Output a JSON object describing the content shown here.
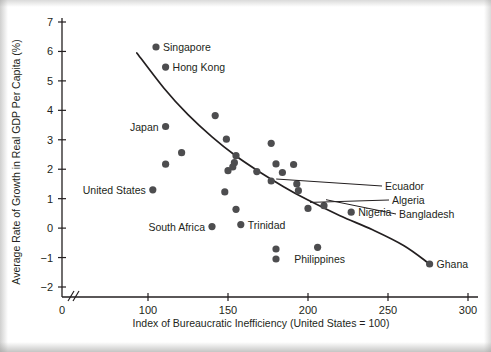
{
  "chart_data": {
    "type": "scatter",
    "title": "",
    "xlabel": "Index of Bureaucratic Inefficiency (United States = 100)",
    "ylabel": "Average Rate of Growth in Real GDP Per Capita (%)",
    "xlim": [
      88,
      305
    ],
    "ylim": [
      -2.6,
      7.3
    ],
    "xticks": [
      0,
      100,
      150,
      200,
      250,
      300
    ],
    "yticks": [
      -2,
      -1,
      0,
      1,
      2,
      3,
      4,
      5,
      6,
      7
    ],
    "xtick_labels": [
      "0",
      "100",
      "150",
      "200",
      "250",
      "300"
    ],
    "ytick_labels": [
      "−2",
      "−1",
      "0",
      "1",
      "2",
      "3",
      "4",
      "5",
      "6",
      "7"
    ],
    "grid": false,
    "legend": null,
    "axis_break": true,
    "axis_break_note": "x-axis broken between 0 and 100",
    "points": [
      {
        "label": "Singapore",
        "x": 105,
        "y": 6.15,
        "label_pos": "right"
      },
      {
        "label": "Hong Kong",
        "x": 111,
        "y": 5.47,
        "label_pos": "right"
      },
      {
        "label": "Japan",
        "x": 111,
        "y": 3.45,
        "label_pos": "left"
      },
      {
        "label": "United States",
        "x": 103,
        "y": 1.3,
        "label_pos": "left"
      },
      {
        "label": "South Africa",
        "x": 140,
        "y": 0.05,
        "label_pos": "left"
      },
      {
        "label": "Trinidad",
        "x": 158,
        "y": 0.12,
        "label_pos": "right"
      },
      {
        "label": "Ecuador",
        "x": 177,
        "y": 1.6,
        "label_pos": "leader"
      },
      {
        "label": "Algeria",
        "x": 200,
        "y": 0.67,
        "label_pos": "leader"
      },
      {
        "label": "Bangladesh",
        "x": 210,
        "y": 0.76,
        "label_pos": "leader"
      },
      {
        "label": "Nigeria",
        "x": 227,
        "y": 0.54,
        "label_pos": "right"
      },
      {
        "label": "Philippines",
        "x": 206,
        "y": -0.65,
        "label_pos": "below"
      },
      {
        "label": "Ghana",
        "x": 276,
        "y": -1.22,
        "label_pos": "right"
      },
      {
        "label": "",
        "x": 142,
        "y": 3.82,
        "label_pos": "none"
      },
      {
        "label": "",
        "x": 149,
        "y": 3.02,
        "label_pos": "none"
      },
      {
        "label": "",
        "x": 177,
        "y": 2.88,
        "label_pos": "none"
      },
      {
        "label": "",
        "x": 121,
        "y": 2.56,
        "label_pos": "none"
      },
      {
        "label": "",
        "x": 155,
        "y": 2.46,
        "label_pos": "none"
      },
      {
        "label": "",
        "x": 154,
        "y": 2.22,
        "label_pos": "none"
      },
      {
        "label": "",
        "x": 111,
        "y": 2.17,
        "label_pos": "none"
      },
      {
        "label": "",
        "x": 180,
        "y": 2.18,
        "label_pos": "none"
      },
      {
        "label": "",
        "x": 191,
        "y": 2.16,
        "label_pos": "none"
      },
      {
        "label": "",
        "x": 153,
        "y": 2.08,
        "label_pos": "none"
      },
      {
        "label": "",
        "x": 150,
        "y": 1.95,
        "label_pos": "none"
      },
      {
        "label": "",
        "x": 168,
        "y": 1.92,
        "label_pos": "none"
      },
      {
        "label": "",
        "x": 184,
        "y": 1.89,
        "label_pos": "none"
      },
      {
        "label": "",
        "x": 193,
        "y": 1.5,
        "label_pos": "none"
      },
      {
        "label": "",
        "x": 194,
        "y": 1.27,
        "label_pos": "none"
      },
      {
        "label": "",
        "x": 148,
        "y": 1.23,
        "label_pos": "none"
      },
      {
        "label": "",
        "x": 155,
        "y": 0.64,
        "label_pos": "none"
      },
      {
        "label": "",
        "x": 180,
        "y": -0.71,
        "label_pos": "none"
      },
      {
        "label": "",
        "x": 180,
        "y": -1.05,
        "label_pos": "none"
      }
    ],
    "trend_curve": {
      "description": "fitted decreasing curve",
      "points": [
        {
          "x": 93,
          "y": 5.95
        },
        {
          "x": 110,
          "y": 4.75
        },
        {
          "x": 125,
          "y": 3.85
        },
        {
          "x": 140,
          "y": 3.1
        },
        {
          "x": 155,
          "y": 2.45
        },
        {
          "x": 170,
          "y": 1.9
        },
        {
          "x": 185,
          "y": 1.4
        },
        {
          "x": 200,
          "y": 0.95
        },
        {
          "x": 220,
          "y": 0.42
        },
        {
          "x": 240,
          "y": -0.05
        },
        {
          "x": 260,
          "y": -0.6
        },
        {
          "x": 276,
          "y": -1.22
        }
      ]
    },
    "colors": {
      "point": "#4d4d4f",
      "axis": "#231f20",
      "curve": "#231f20",
      "background": "#ffffff"
    }
  }
}
